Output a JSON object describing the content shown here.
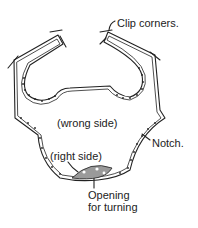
{
  "diagram": {
    "labels": {
      "clip_corners": "Clip corners.",
      "wrong_side": "(wrong side)",
      "notch": "Notch.",
      "right_side": "(right side)",
      "opening_line1": "Opening",
      "opening_line2": "for turning"
    },
    "caption_clipped": "",
    "colors": {
      "line": "#222222",
      "fill_opening": "#9a9a9a",
      "background": "#ffffff"
    }
  }
}
